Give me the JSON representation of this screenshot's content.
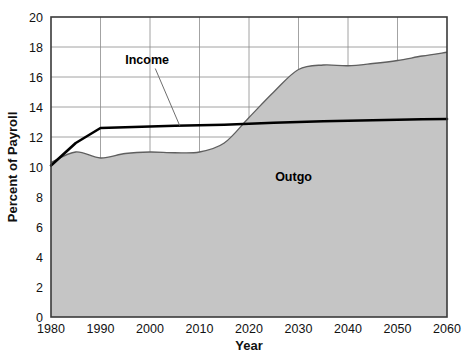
{
  "chart_data": {
    "type": "area",
    "title": "",
    "xlabel": "Year",
    "ylabel": "Percent of Payroll",
    "xlim": [
      1980,
      2060
    ],
    "ylim": [
      0,
      20
    ],
    "grid": true,
    "legend_position": "inline-annotations",
    "x_ticks": [
      1980,
      1990,
      2000,
      2010,
      2020,
      2030,
      2040,
      2050,
      2060
    ],
    "x_tick_labels": [
      "1980",
      "1990",
      "2000",
      "2010",
      "2020",
      "2030",
      "2040",
      "2050",
      "2060"
    ],
    "y_ticks": [
      0,
      2,
      4,
      6,
      8,
      10,
      12,
      14,
      16,
      18,
      20
    ],
    "y_tick_labels": [
      "0",
      "2",
      "4",
      "6",
      "8",
      "10",
      "12",
      "14",
      "16",
      "18",
      "20"
    ],
    "x": [
      1980,
      1985,
      1990,
      1995,
      2000,
      2005,
      2010,
      2015,
      2020,
      2025,
      2030,
      2035,
      2040,
      2045,
      2050,
      2055,
      2060
    ],
    "series": [
      {
        "name": "Income",
        "kind": "line",
        "color": "#000000",
        "values": [
          10.1,
          11.6,
          12.6,
          12.65,
          12.7,
          12.75,
          12.78,
          12.82,
          12.88,
          12.95,
          13.0,
          13.05,
          13.08,
          13.12,
          13.15,
          13.18,
          13.2
        ]
      },
      {
        "name": "Outgo",
        "kind": "area",
        "color": "#c4c4c4",
        "line_color": "#5a5a5a",
        "values": [
          10.3,
          11.0,
          10.6,
          10.9,
          11.0,
          10.95,
          11.0,
          11.6,
          13.3,
          15.0,
          16.5,
          16.8,
          16.75,
          16.9,
          17.1,
          17.4,
          17.65
        ]
      }
    ],
    "annotations": [
      {
        "name": "Income",
        "label": "Income",
        "label_x": 1995,
        "label_y": 16.9,
        "leader_to_x": 2006,
        "leader_to_y": 12.76
      },
      {
        "name": "Outgo",
        "label": "Outgo",
        "label_x": 2029,
        "label_y": 9.1
      }
    ]
  }
}
